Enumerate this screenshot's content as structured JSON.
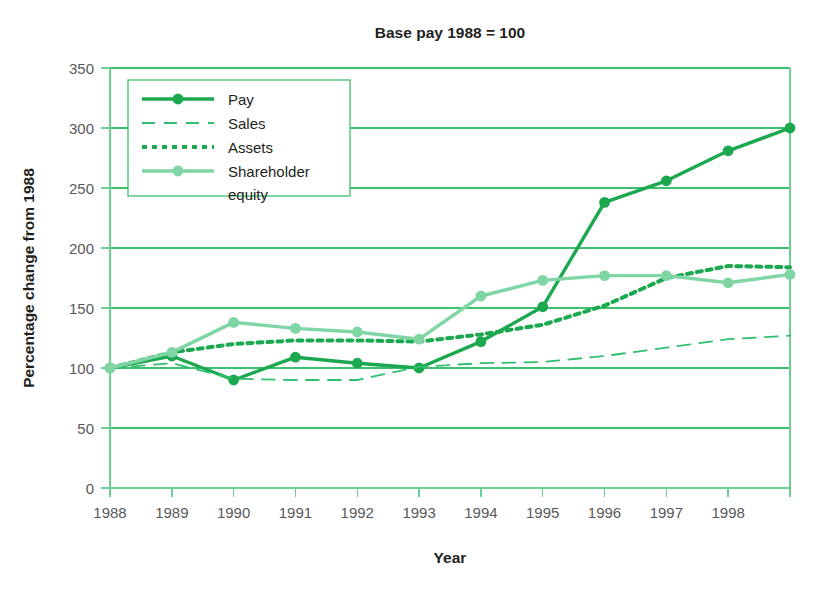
{
  "chart_data": {
    "type": "line",
    "title": "Base pay 1988 = 100",
    "xlabel": "Year",
    "ylabel": "Percentage change from 1988",
    "xlim": [
      1988,
      1999
    ],
    "ylim": [
      0,
      350
    ],
    "yticks": [
      0,
      50,
      100,
      150,
      200,
      250,
      300,
      350
    ],
    "xticks": [
      1988,
      1989,
      1990,
      1991,
      1992,
      1993,
      1994,
      1995,
      1996,
      1997,
      1998,
      1999
    ],
    "xtick_labels": [
      "1988",
      "1989",
      "1990",
      "1991",
      "1992",
      "1993",
      "1994",
      "1995",
      "1996",
      "1997",
      "1998",
      ""
    ],
    "grid": "horizontal",
    "legend_position": "top-left",
    "x": [
      1988,
      1989,
      1990,
      1991,
      1992,
      1993,
      1994,
      1995,
      1996,
      1997,
      1998,
      1999
    ],
    "series": [
      {
        "name": "Pay",
        "style": "solid",
        "color": "#1BA84F",
        "markers": true,
        "values": [
          100,
          110,
          90,
          109,
          104,
          100,
          122,
          151,
          238,
          256,
          281,
          300
        ]
      },
      {
        "name": "Sales",
        "style": "dashed",
        "color": "#2FBF6E",
        "markers": false,
        "values": [
          100,
          104,
          91,
          90,
          90,
          101,
          104,
          105,
          110,
          117,
          124,
          127
        ]
      },
      {
        "name": "Assets",
        "style": "dotted",
        "color": "#1BA84F",
        "markers": false,
        "values": [
          100,
          113,
          120,
          123,
          123,
          122,
          128,
          136,
          152,
          175,
          185,
          184
        ]
      },
      {
        "name": "Shareholder equity",
        "style": "solid",
        "color": "#7FD6A4",
        "markers": true,
        "values": [
          100,
          113,
          138,
          133,
          130,
          124,
          160,
          173,
          177,
          177,
          171,
          178
        ]
      }
    ]
  },
  "legend": {
    "entries": [
      {
        "label": "Pay"
      },
      {
        "label": "Sales"
      },
      {
        "label": "Assets"
      },
      {
        "label": "Shareholder"
      },
      {
        "label": "equity"
      }
    ]
  }
}
